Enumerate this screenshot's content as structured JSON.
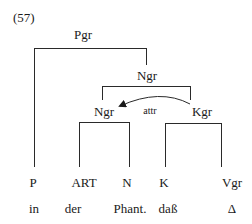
{
  "example_number": "(57)",
  "nodes": {
    "pgr": "Pgr",
    "ngr_upper": "Ngr",
    "ngr_lower": "Ngr",
    "kgr": "Kgr"
  },
  "relation_label": "attr",
  "categories": [
    {
      "label": "P",
      "word": "in"
    },
    {
      "label": "ART",
      "word": "der"
    },
    {
      "label": "N",
      "word": "Phant."
    },
    {
      "label": "K",
      "word": "daß"
    },
    {
      "label": "Vgr",
      "word": "Δ"
    }
  ]
}
